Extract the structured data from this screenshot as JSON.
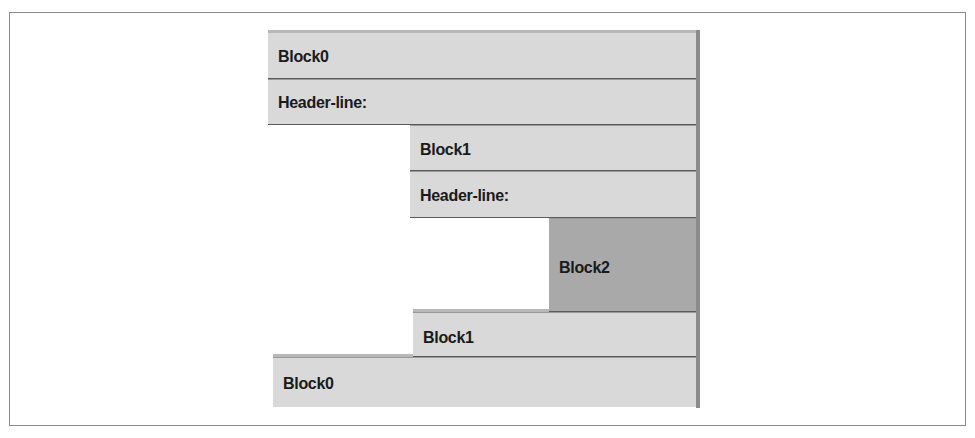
{
  "diagram": {
    "title": "",
    "rows": [
      {
        "id": "block0-top",
        "label": "Block0",
        "level": 0,
        "shade": "light"
      },
      {
        "id": "header-line-0",
        "label": "Header-line:",
        "level": 0,
        "shade": "light"
      },
      {
        "id": "block1-top",
        "label": "Block1",
        "level": 1,
        "shade": "light"
      },
      {
        "id": "header-line-1",
        "label": "Header-line:",
        "level": 1,
        "shade": "light"
      },
      {
        "id": "block2",
        "label": "Block2",
        "level": 2,
        "shade": "dark"
      },
      {
        "id": "block1-bottom",
        "label": "Block1",
        "level": 1,
        "shade": "light"
      },
      {
        "id": "block0-bottom",
        "label": "Block0",
        "level": 0,
        "shade": "light"
      }
    ],
    "colors": {
      "light_block": "#d9d9d9",
      "dark_block": "#a9a9a9",
      "separator": "#5a5a5a",
      "frame": "#8a8a8a"
    }
  }
}
